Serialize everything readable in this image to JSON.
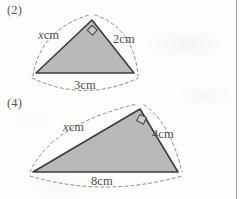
{
  "page": {
    "background_color": "#fdfdfc",
    "rule_color": "#9a9a9a",
    "width": 247,
    "height": 199
  },
  "style": {
    "triangle_fill": "#b9b9b9",
    "triangle_stroke": "#3c3c3c",
    "arc_stroke": "#7a7a7a",
    "text_color": "#4f4f4f"
  },
  "figures": [
    {
      "number": "(2)",
      "name": "right-triangle-figure-2",
      "right_angle_at": "apex",
      "vertices": {
        "left": [
          36,
          73
        ],
        "apex": [
          92,
          20
        ],
        "right": [
          134,
          73
        ]
      },
      "labels": {
        "hypotenuse_or_left_side": {
          "variable": "x",
          "unit": "cm"
        },
        "right_side": {
          "value": "2",
          "unit": "cm"
        },
        "base": {
          "value": "3",
          "unit": "cm"
        }
      },
      "label_text": {
        "left_side": "xcm",
        "right_side": "2cm",
        "base": "3cm"
      }
    },
    {
      "number": "(4)",
      "name": "right-triangle-figure-4",
      "right_angle_at": "apex",
      "vertices": {
        "left": [
          33,
          172
        ],
        "apex": [
          140,
          109
        ],
        "right": [
          178,
          172
        ]
      },
      "labels": {
        "long_side": {
          "variable": "x",
          "unit": "cm"
        },
        "right_side": {
          "value": "4",
          "unit": "cm"
        },
        "base": {
          "value": "8",
          "unit": "cm"
        }
      },
      "label_text": {
        "long_side": "xcm",
        "right_side": "4cm",
        "base": "8cm"
      }
    }
  ],
  "measure_unit": "cm",
  "variable_symbol": "x"
}
